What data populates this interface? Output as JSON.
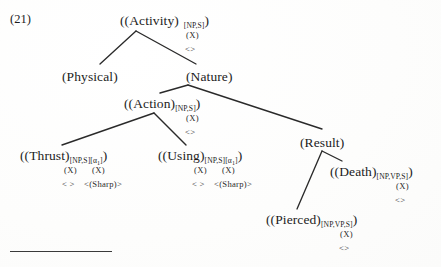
{
  "example": {
    "number": "(21)"
  },
  "tree": {
    "type": "semantic-feature-tree",
    "nodes": [
      {
        "id": "activity",
        "label": "((Activity)",
        "subscript": "[NP,S]",
        "tail": ")",
        "features": [
          "(X)",
          "<>"
        ],
        "x": 120,
        "y": 12
      },
      {
        "id": "physical",
        "label": "(Physical)",
        "subscript": "",
        "tail": "",
        "features": [],
        "x": 62,
        "y": 68
      },
      {
        "id": "nature",
        "label": "(Nature)",
        "subscript": "",
        "tail": "",
        "features": [],
        "x": 186,
        "y": 68
      },
      {
        "id": "action",
        "label": "((Action)",
        "subscript": "[NP,S]",
        "tail": ")",
        "features": [
          "(X)",
          "<>"
        ],
        "x": 124,
        "y": 95
      },
      {
        "id": "result",
        "label": "(Result)",
        "subscript": "",
        "tail": "",
        "features": [],
        "x": 300,
        "y": 134
      },
      {
        "id": "thrust",
        "label": "((Thrust)",
        "subscript": "[NP,S][α",
        "subscript_index": "1",
        "subscript_close": "]",
        "tail": ")",
        "features_row1": [
          "(X)",
          "(X)"
        ],
        "features_row2": [
          "< >",
          "<(Sharp)>"
        ],
        "x": 20,
        "y": 147
      },
      {
        "id": "using",
        "label": "((Using)",
        "subscript": "[NP,S][α",
        "subscript_index": "1",
        "subscript_close": "]",
        "tail": ")",
        "features_row1": [
          "(X)",
          "(X)"
        ],
        "features_row2": [
          "< >",
          "<(Sharp)>"
        ],
        "x": 158,
        "y": 147
      },
      {
        "id": "death",
        "label": "((Death)",
        "subscript": "[NP,VP,S]",
        "tail": ")",
        "features": [
          "(X)",
          "<>"
        ],
        "x": 330,
        "y": 163
      },
      {
        "id": "pierced",
        "label": "((Pierced)",
        "subscript": "[NP,VP,S]",
        "tail": ")",
        "features": [
          "(X)",
          "<>"
        ],
        "x": 266,
        "y": 211
      }
    ],
    "branches": [
      {
        "from": "activity",
        "to": "physical",
        "x1": 136,
        "y1": 31,
        "x2": 100,
        "y2": 64
      },
      {
        "from": "activity",
        "to": "nature",
        "x1": 136,
        "y1": 31,
        "x2": 196,
        "y2": 64
      },
      {
        "from": "nature",
        "to": "action",
        "x1": 188,
        "y1": 85,
        "x2": 160,
        "y2": 93
      },
      {
        "from": "nature",
        "to": "result",
        "x1": 188,
        "y1": 85,
        "x2": 322,
        "y2": 129
      },
      {
        "from": "action",
        "to": "thrust",
        "x1": 154,
        "y1": 113,
        "x2": 62,
        "y2": 145
      },
      {
        "from": "action",
        "to": "using",
        "x1": 154,
        "y1": 113,
        "x2": 186,
        "y2": 145
      },
      {
        "from": "result",
        "to": "pierced",
        "x1": 322,
        "y1": 151,
        "x2": 297,
        "y2": 209
      },
      {
        "from": "result",
        "to": "death",
        "x1": 322,
        "y1": 151,
        "x2": 342,
        "y2": 161
      }
    ]
  },
  "footnote_rule": {
    "x": 10,
    "y": 251,
    "width": 102
  },
  "colors": {
    "ink": "#1c1c1c",
    "rule": "#3a3a3a",
    "page": "#ffffff"
  }
}
